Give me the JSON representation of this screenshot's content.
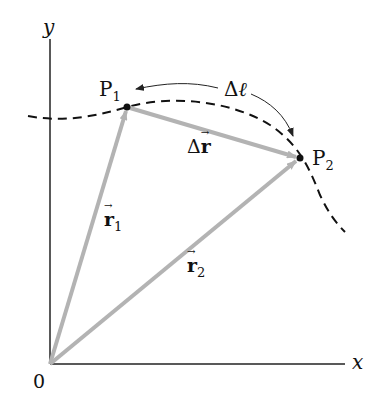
{
  "diagram": {
    "axes": {
      "x_label": "x",
      "y_label": "y",
      "origin_label": "0"
    },
    "points": [
      {
        "name": "P",
        "subscript": "1",
        "x": 127,
        "y": 107
      },
      {
        "name": "P",
        "subscript": "2",
        "x": 300,
        "y": 158
      }
    ],
    "vectors": [
      {
        "symbol": "r",
        "subscript": "1",
        "from": "0",
        "to": "P1"
      },
      {
        "symbol": "r",
        "subscript": "2",
        "from": "0",
        "to": "P2"
      },
      {
        "symbol": "Δr",
        "prefix": "Δ",
        "base": "r",
        "from": "P1",
        "to": "P2"
      }
    ],
    "arc_label": {
      "prefix": "Δ",
      "symbol": "ℓ"
    },
    "colors": {
      "vector": "#b3b3b3",
      "axis": "#222222",
      "path": "#111111"
    }
  }
}
